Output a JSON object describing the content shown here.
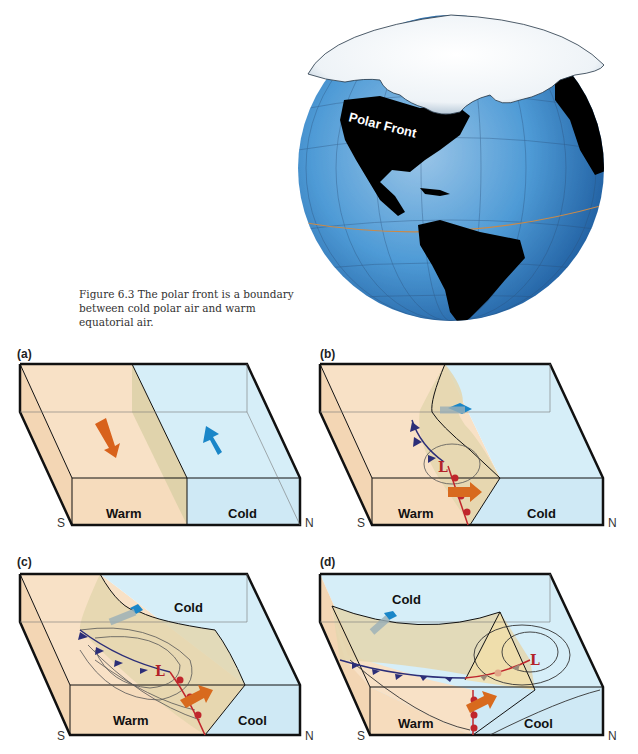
{
  "figure": {
    "caption": "Figure 6.3  The polar front is a boundary between cold polar air and warm equatorial air.",
    "globe": {
      "label": "Polar Front",
      "ocean_color": "#3d8fd0",
      "land_color": "#000000",
      "ice_color": "#f4f7fa",
      "equator_color": "#c98a4a"
    },
    "colors": {
      "warm_air": "#f8e1c6",
      "cold_air": "#d6eef8",
      "front_surface": "#e4d6ae",
      "cold_front": "#2c2e78",
      "warm_front": "#c0262c",
      "warm_arrow": "#d86a1e",
      "cold_arrow": "#1a86c8",
      "low_symbol": "#b3232a"
    },
    "panels": [
      {
        "id": "a",
        "label": "(a)",
        "south": "S",
        "north": "N",
        "labels": [
          "Warm",
          "Cold"
        ]
      },
      {
        "id": "b",
        "label": "(b)",
        "south": "S",
        "north": "N",
        "labels": [
          "Warm",
          "Cold"
        ],
        "low": "L"
      },
      {
        "id": "c",
        "label": "(c)",
        "south": "S",
        "north": "N",
        "labels": [
          "Cold",
          "Warm",
          "Cool"
        ],
        "low": "L"
      },
      {
        "id": "d",
        "label": "(d)",
        "south": "S",
        "north": "N",
        "labels": [
          "Cold",
          "Warm",
          "Cool"
        ],
        "low": "L"
      }
    ]
  }
}
